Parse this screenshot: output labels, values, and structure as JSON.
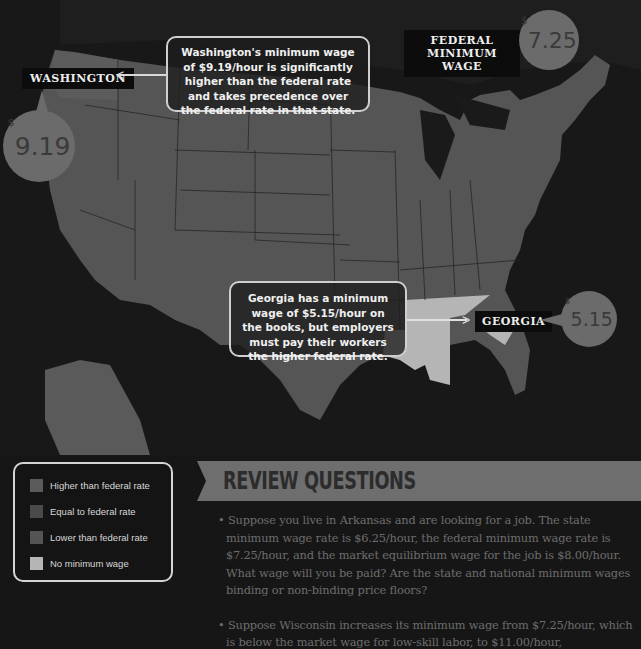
{
  "map": {
    "title": "State minimum wage vs federal minimum wage",
    "federal": {
      "label_line1": "FEDERAL",
      "label_line2": "MINIMUM WAGE",
      "currency": "$",
      "amount": "7.25"
    },
    "washington": {
      "label": "WASHINGTON",
      "currency": "$",
      "amount": "9.19",
      "callout": "Washington's minimum wage of $9.19/hour is significantly higher than the federal rate and takes precedence over the federal rate in that state."
    },
    "georgia": {
      "label": "GEORGIA",
      "currency": "$",
      "amount": "5.15",
      "callout": "Georgia has a minimum wage of $5.15/hour on the books, but employers must pay their workers the higher federal rate."
    },
    "colors": {
      "higher": "#5a5a5a",
      "equal": "#4a4a4a",
      "lower": "#555555",
      "none": "#b8b8b8",
      "water": "#171717"
    }
  },
  "legend": {
    "items": [
      {
        "label": "Higher than federal rate",
        "color": "#5a5a5a"
      },
      {
        "label": "Equal to federal rate",
        "color": "#4a4a4a"
      },
      {
        "label": "Lower than federal rate",
        "color": "#545454"
      },
      {
        "label": "No minimum wage",
        "color": "#b5b5b5"
      }
    ]
  },
  "review": {
    "title": "REVIEW QUESTIONS",
    "questions": [
      "Suppose you live in Arkansas and are looking for a job.  The state minimum wage rate is $6.25/hour, the federal minimum wage rate is $7.25/hour, and the market equilibrium wage for the job is $8.00/hour. What wage will you be paid?  Are the state and national minimum wages binding or non-binding price floors?",
      "Suppose Wisconsin increases its minimum wage from $7.25/hour, which is below the market wage for low-skill labor, to $11.00/hour,"
    ]
  }
}
